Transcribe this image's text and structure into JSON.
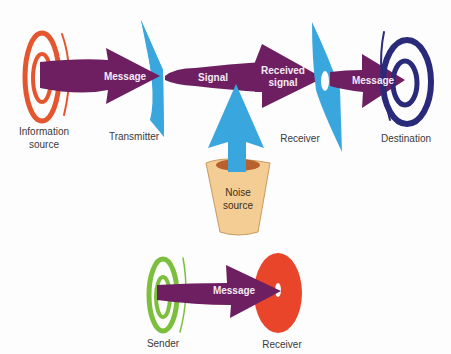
{
  "colors": {
    "arrow": "#6e1f62",
    "device": "#3aa6de",
    "info_source": "#e4572e",
    "destination": "#2a2a7a",
    "noise_cup": "#f3cd94",
    "noise_cup_inner": "#b8612e",
    "sender": "#7cbf3c",
    "receiver_simple": "#e8452a"
  },
  "top_model": {
    "nodes": {
      "information_source": {
        "label_line1": "Information",
        "label_line2": "source"
      },
      "transmitter": {
        "label": "Transmitter"
      },
      "receiver": {
        "label": "Receiver"
      },
      "destination": {
        "label": "Destination"
      },
      "noise_source": {
        "label_line1": "Noise",
        "label_line2": "source"
      }
    },
    "arrows": {
      "message_1": "Message",
      "signal": "Signal",
      "received_signal_line1": "Received",
      "received_signal_line2": "signal",
      "message_2": "Message"
    }
  },
  "bottom_model": {
    "nodes": {
      "sender": {
        "label": "Sender"
      },
      "receiver": {
        "label": "Receiver"
      }
    },
    "arrows": {
      "message": "Message"
    }
  }
}
